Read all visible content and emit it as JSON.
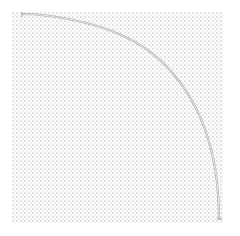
{
  "figure": {
    "title": "",
    "background_color": "#ffffff",
    "canvas": {
      "width": 240,
      "height": 236
    }
  },
  "plot_area": {
    "name": "dotted-grid-field",
    "left": 12,
    "top": 12,
    "width": 211,
    "height": 211,
    "grid": "dotted",
    "grid_spacing_px": 4,
    "grid_dot_color": "#e2e2e2",
    "background_color": "#ffffff",
    "axes_visible": false,
    "tick_labels": []
  },
  "chart_data": {
    "type": "line",
    "title": "",
    "subtitle": "",
    "xlabel": "",
    "ylabel": "",
    "grid": true,
    "legend": [],
    "legend_position": "none",
    "annotations": [],
    "xlim": [
      0,
      1
    ],
    "ylim": [
      0,
      1
    ],
    "series": [
      {
        "name": "quarter-arc",
        "shape": "quarter_circle_arc",
        "stroke_color": "#9a9a9a",
        "stroke_width_px": 2,
        "fill": "none",
        "center_px": [
          22,
          219
        ],
        "radius_px": 205,
        "start_angle_deg": 90,
        "end_angle_deg": 0,
        "start_point_px": [
          22,
          14
        ],
        "end_point_px": [
          219,
          219
        ],
        "x": [
          0.0,
          0.05,
          0.1,
          0.2,
          0.3,
          0.4,
          0.5,
          0.6,
          0.7,
          0.8,
          0.9,
          0.95,
          1.0
        ],
        "y": [
          1.0,
          0.999,
          0.995,
          0.98,
          0.954,
          0.917,
          0.866,
          0.8,
          0.714,
          0.6,
          0.436,
          0.312,
          0.0
        ]
      }
    ]
  },
  "curve_geometry": {
    "path": "M 22 14 C 22 14, 110 14, 160 60 C 205 102, 219 160, 219 219",
    "highlight_path": "M 22 14 C 22 14, 110 14, 160 60 C 205 102, 219 160, 219 219",
    "start_tick": "M 22 12 L 22 17",
    "end_tick": "M 217 219 L 222 219"
  }
}
